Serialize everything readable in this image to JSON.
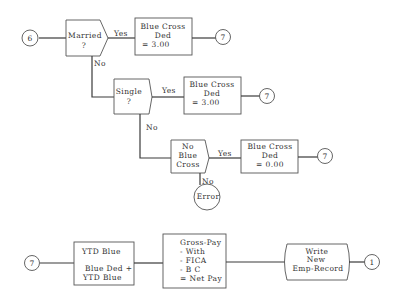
{
  "diagram": {
    "type": "flowchart",
    "connectors": {
      "start": "6",
      "married_yes_exit": "7",
      "single_yes_exit": "7",
      "noblue_yes_exit": "7",
      "bottom_entry": "7",
      "end": "1"
    },
    "decisions": {
      "married": {
        "line1": "Married",
        "line2": "?",
        "yes_label": "Yes",
        "no_label": "No"
      },
      "single": {
        "line1": "Single",
        "line2": "?",
        "yes_label": "Yes",
        "no_label": "No"
      },
      "no_blue_cross": {
        "line1": "No",
        "line2": "Blue",
        "line3": "Cross",
        "yes_label": "Yes",
        "no_label": "No"
      }
    },
    "processes": {
      "married_ded": {
        "line1": "Blue Cross",
        "line2": "Ded",
        "line3": "= 3.00"
      },
      "single_ded": {
        "line1": "Blue Cross",
        "line2": "Ded",
        "line3": "= 3.00"
      },
      "noblue_ded": {
        "line1": "Blue Cross",
        "line2": "Ded",
        "line3": "= 0.00"
      },
      "ytd_blue": {
        "line1": "YTD Blue",
        "line2": "Blue Ded +",
        "line3": "YTD Blue"
      },
      "gross_pay": {
        "line1": "Gross-Pay",
        "line2": "- With",
        "line3": "- FICA",
        "line4": "- B C",
        "line5": "= Net Pay"
      }
    },
    "terminals": {
      "error": "Error"
    },
    "io": {
      "write_record": {
        "line1": "Write",
        "line2": "New",
        "line3": "Emp-Record"
      }
    }
  }
}
